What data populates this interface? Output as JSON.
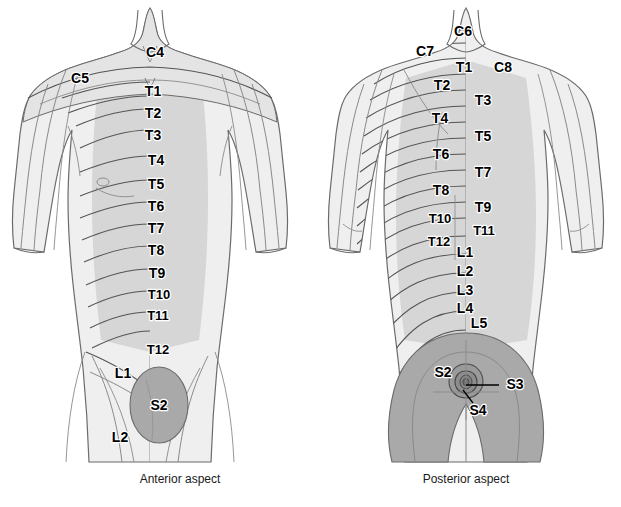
{
  "figure": {
    "colors": {
      "background": "#ffffff",
      "skin_light": "#efefef",
      "torso_mid": "#d4d4d4",
      "sacral_dark": "#a9a9a9",
      "outline": "#6b6b6b",
      "segment_line": "#545454",
      "label_text": "#000000"
    },
    "panels": [
      {
        "id": "anterior",
        "caption": "Anterior aspect",
        "caption_x": 180,
        "caption_y": 472,
        "labels": [
          {
            "text": "C4",
            "x": 155,
            "y": 53
          },
          {
            "text": "C5",
            "x": 80,
            "y": 79
          },
          {
            "text": "T1",
            "x": 153,
            "y": 92
          },
          {
            "text": "T2",
            "x": 153,
            "y": 114
          },
          {
            "text": "T3",
            "x": 153,
            "y": 136
          },
          {
            "text": "T4",
            "x": 156,
            "y": 161
          },
          {
            "text": "T5",
            "x": 156,
            "y": 185
          },
          {
            "text": "T6",
            "x": 156,
            "y": 207
          },
          {
            "text": "T7",
            "x": 156,
            "y": 229
          },
          {
            "text": "T8",
            "x": 156,
            "y": 251
          },
          {
            "text": "T9",
            "x": 157,
            "y": 274
          },
          {
            "text": "T10",
            "x": 159,
            "y": 296
          },
          {
            "text": "T11",
            "x": 158,
            "y": 317
          },
          {
            "text": "T12",
            "x": 158,
            "y": 351
          },
          {
            "text": "L1",
            "x": 123,
            "y": 374
          },
          {
            "text": "S2",
            "x": 159,
            "y": 406
          },
          {
            "text": "L2",
            "x": 120,
            "y": 438
          }
        ]
      },
      {
        "id": "posterior",
        "caption": "Posterior aspect",
        "caption_x": 466,
        "caption_y": 472,
        "labels": [
          {
            "text": "C6",
            "x": 463,
            "y": 32
          },
          {
            "text": "C7",
            "x": 425,
            "y": 52
          },
          {
            "text": "T1",
            "x": 464,
            "y": 68
          },
          {
            "text": "C8",
            "x": 503,
            "y": 68
          },
          {
            "text": "T2",
            "x": 442,
            "y": 86
          },
          {
            "text": "T3",
            "x": 483,
            "y": 101
          },
          {
            "text": "T4",
            "x": 440,
            "y": 119
          },
          {
            "text": "T5",
            "x": 483,
            "y": 137
          },
          {
            "text": "T6",
            "x": 441,
            "y": 155
          },
          {
            "text": "T7",
            "x": 483,
            "y": 173
          },
          {
            "text": "T8",
            "x": 441,
            "y": 191
          },
          {
            "text": "T9",
            "x": 483,
            "y": 208
          },
          {
            "text": "T10",
            "x": 440,
            "y": 220
          },
          {
            "text": "T11",
            "x": 484,
            "y": 232
          },
          {
            "text": "T12",
            "x": 439,
            "y": 243
          },
          {
            "text": "L1",
            "x": 465,
            "y": 253
          },
          {
            "text": "L2",
            "x": 465,
            "y": 272
          },
          {
            "text": "L3",
            "x": 465,
            "y": 291
          },
          {
            "text": "L4",
            "x": 465,
            "y": 309
          },
          {
            "text": "L5",
            "x": 479,
            "y": 324
          },
          {
            "text": "S2",
            "x": 443,
            "y": 373
          },
          {
            "text": "S3",
            "x": 515,
            "y": 385
          },
          {
            "text": "S4",
            "x": 478,
            "y": 411
          }
        ],
        "leaders": [
          {
            "name": "s3-leader",
            "from_x": 499,
            "from_y": 385,
            "to_x": 466,
            "to_y": 385
          },
          {
            "name": "s4-leader",
            "from_x": 473,
            "from_y": 403,
            "to_x": 463,
            "to_y": 390
          }
        ]
      }
    ]
  }
}
